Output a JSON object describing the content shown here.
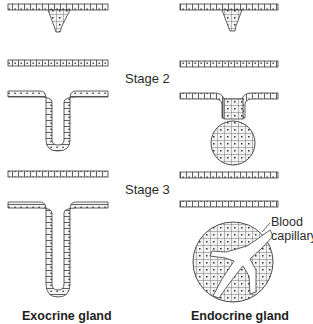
{
  "figure": {
    "columns": [
      {
        "id": "exocrine",
        "label": "Exocrine gland"
      },
      {
        "id": "endocrine",
        "label": "Endocrine gland"
      }
    ],
    "stages": [
      {
        "id": "stage1",
        "label": ""
      },
      {
        "id": "stage2",
        "label": "Stage 2"
      },
      {
        "id": "stage3",
        "label": "Stage 3"
      }
    ],
    "annotations": {
      "capillary_line1": "Blood",
      "capillary_line2": "capillary"
    },
    "colors": {
      "line": "#3a3a3a",
      "cell_fill": "#f4f4f4",
      "nucleus": "#333333",
      "background": "#ffffff"
    }
  }
}
